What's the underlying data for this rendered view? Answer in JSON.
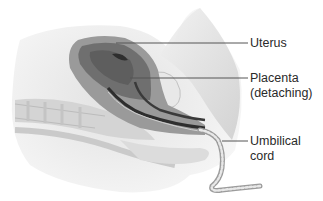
{
  "diagram": {
    "type": "anatomical-illustration",
    "colors": {
      "background": "#ffffff",
      "tissue_light": "#e6e6e6",
      "tissue_mid": "#b8b8b8",
      "uterus_wall": "#8c8c8c",
      "placenta": "#6a6a6a",
      "dark_channel": "#2e2e2e",
      "leader_line": "#555555",
      "label_text": "#2a2a2a"
    },
    "labels": [
      {
        "id": "uterus",
        "lines": [
          "Uterus"
        ]
      },
      {
        "id": "placenta",
        "lines": [
          "Placenta",
          "(detaching)"
        ]
      },
      {
        "id": "umbilical-cord",
        "lines": [
          "Umbilical",
          "cord"
        ]
      }
    ]
  }
}
